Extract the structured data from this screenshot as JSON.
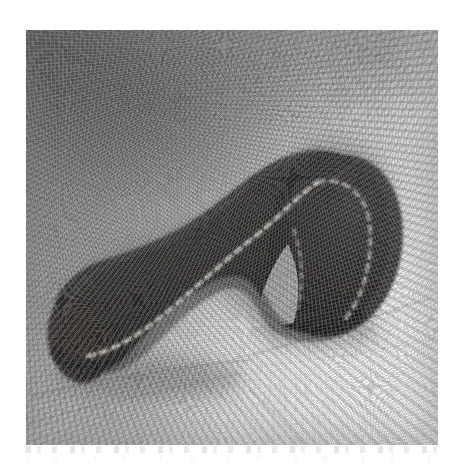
{
  "figure": {
    "kind": "scanned-photograph",
    "caption": "",
    "subject_label": "curved segmented dark specimen",
    "background_label": "light textured cloth",
    "plate": {
      "left": 26,
      "top": 30,
      "width": 412,
      "height": 415
    },
    "page_background_color": "#ffffff"
  },
  "palette": {
    "page_background": "#ffffff",
    "specimen_dark": "#33312f",
    "specimen_darkest": "#1d1c1b",
    "specimen_edge": "#4a4845",
    "highlight_line": "#cfcdc6",
    "background_light": "#f6f5f3",
    "background_mid": "#c0c0bd",
    "background_dark": "#7a7a78",
    "vignette_corner": "#5a5a58",
    "cast_shadow": "#8a8a87"
  },
  "specimen": {
    "name": "specimen-body",
    "description": "thick dark S/J-shaped body, blunt rounded left terminus, sweeping up to the right into a hooked curl that folds back downward",
    "orientation": "left terminus low-left, hook curl at right",
    "segmentation_highlight": "dotted light specular line running the full length of the body",
    "bounding_box": {
      "x": 48,
      "y": 148,
      "width": 342,
      "height": 235
    },
    "left_terminus": {
      "x": 60,
      "y": 338
    },
    "apex": {
      "x": 300,
      "y": 152
    },
    "hook_tip": {
      "x": 330,
      "y": 312
    },
    "notch_apex": {
      "x": 286,
      "y": 250
    }
  },
  "background_features": {
    "vignette_corner": "upper-left",
    "bright_corner": "lower-right",
    "fold_lines": [
      {
        "name": "fold-under-body",
        "from_x": 36,
        "from_y": 392,
        "to_x": 248,
        "to_y": 358
      },
      {
        "name": "fold-lower-left",
        "from_x": 28,
        "from_y": 418,
        "to_x": 232,
        "to_y": 372
      },
      {
        "name": "fold-right-diagonal",
        "from_x": 236,
        "from_y": 352,
        "to_x": 404,
        "to_y": 300
      },
      {
        "name": "fold-lower-right",
        "from_x": 252,
        "from_y": 392,
        "to_x": 298,
        "to_y": 444
      }
    ],
    "texture": "fine photographic grain / woven cloth speckle"
  },
  "scan_artifacts": {
    "present": true,
    "description": "faint bleed-through ghost marks in a thin band beneath the photograph",
    "band_top": 446,
    "band_height": 20
  }
}
